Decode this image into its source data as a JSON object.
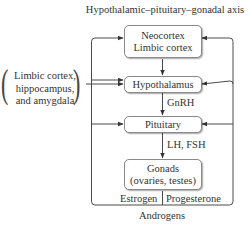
{
  "title": "Hypothalamic–pituitary–gonadal axis",
  "boxes": {
    "neocortex": {
      "line1": "Neocortex",
      "line2": "Limbic cortex"
    },
    "hypothalamus": {
      "label": "Hypothalamus"
    },
    "pituitary": {
      "label": "Pituitary"
    },
    "gonads": {
      "line1": "Gonads",
      "line2": "(ovaries, testes)"
    }
  },
  "side_input": {
    "line1": "Limbic cortex,",
    "line2": "hippocampus,",
    "line3": "and amygdala"
  },
  "edge_labels": {
    "gnrh": "GnRH",
    "lh_fsh": "LH, FSH",
    "estrogen": "Estrogen",
    "progesterone": "Progesterone",
    "androgens": "Androgens"
  },
  "colors": {
    "line": "#4a4a4a",
    "box_border": "#8a8a8a",
    "text": "#333333"
  }
}
